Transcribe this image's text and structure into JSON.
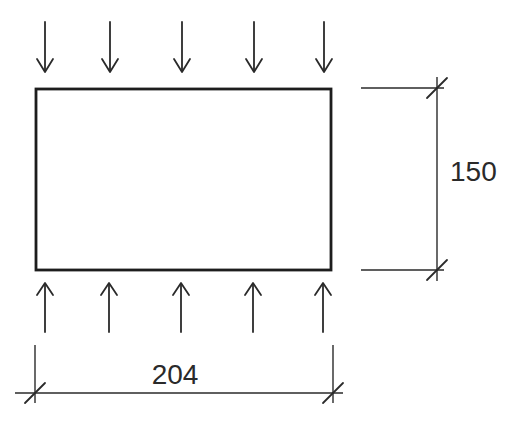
{
  "diagram": {
    "background_color": "#ffffff",
    "line_color": "#2a2a2a",
    "plate_color": "#1d1d1d",
    "top_load": {
      "direction": "down",
      "arrow_count": 5,
      "arrow_x": [
        45,
        110,
        182,
        254,
        324
      ],
      "shaft_top_y": 22,
      "tip_y": 72,
      "head_half_width": 8,
      "head_depth": 13
    },
    "bottom_load": {
      "direction": "up",
      "arrow_count": 5,
      "arrow_x": [
        45,
        109,
        181,
        253,
        323
      ],
      "shaft_bottom_y": 332,
      "tip_y": 283,
      "head_half_width": 8,
      "head_depth": 12
    },
    "height_dimension": {
      "label": "150"
    },
    "width_dimension": {
      "label": "204"
    }
  }
}
